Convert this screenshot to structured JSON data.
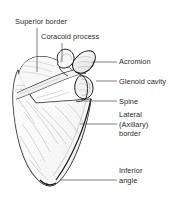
{
  "figure": {
    "view": "anterior (costal) view of right scapula",
    "background_color": "#ffffff",
    "ink_color": "#1a1a1a",
    "text_color": "#2b2b2b",
    "leader_color": "#555555"
  },
  "labels": {
    "superior_border": "Superior border",
    "coracoid_process": "Coracoid process",
    "acromion": "Acromion",
    "glenoid_cavity": "Glenoid cavity",
    "spine": "Spine",
    "lateral_border_line1": "Lateral",
    "lateral_border_line2": "(Axillary)",
    "lateral_border_line3": "border",
    "inferior_angle_line1": "Inferior",
    "inferior_angle_line2": "angle"
  },
  "leaders": [
    {
      "name": "superior-border-leader",
      "x1": 37,
      "y1": 28,
      "x2": 37,
      "y2": 72
    },
    {
      "name": "coracoid-process-leader",
      "x1": 62,
      "y1": 43,
      "x2": 62,
      "y2": 62
    },
    {
      "name": "acromion-leader",
      "x1": 92,
      "y1": 62,
      "x2": 117,
      "y2": 62
    },
    {
      "name": "glenoid-cavity-leader",
      "x1": 96,
      "y1": 81,
      "x2": 117,
      "y2": 81
    },
    {
      "name": "spine-leader",
      "x1": 84,
      "y1": 101,
      "x2": 117,
      "y2": 101
    },
    {
      "name": "lateral-border-leader",
      "x1": 80,
      "y1": 124,
      "x2": 117,
      "y2": 124
    },
    {
      "name": "inferior-angle-leader",
      "x1": 60,
      "y1": 180,
      "x2": 117,
      "y2": 180
    }
  ]
}
